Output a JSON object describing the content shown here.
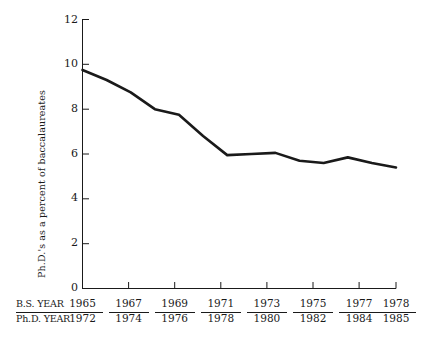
{
  "chart_data": {
    "type": "line",
    "title": "",
    "xlabel": "",
    "ylabel": "Ph.D.'s as a percent of baccalaureates",
    "ylim": [
      0,
      12
    ],
    "yticks": [
      0,
      2,
      4,
      6,
      8,
      10,
      12
    ],
    "ytick_labels": [
      "0",
      "2",
      "4",
      "6",
      "8",
      "10",
      "12"
    ],
    "grid": false,
    "legend": "none",
    "x_axis_rows": [
      {
        "label": "B.S. YEAR",
        "underlined": true
      },
      {
        "label": "Ph.D. YEAR",
        "underlined": false
      }
    ],
    "xtick_labels_bs": [
      "1965",
      "1967",
      "1969",
      "1971",
      "1973",
      "1975",
      "1977",
      "1978"
    ],
    "xtick_labels_phd": [
      "1972",
      "1974",
      "1976",
      "1978",
      "1980",
      "1982",
      "1984",
      "1985"
    ],
    "bs_years": [
      1965,
      1966,
      1967,
      1968,
      1969,
      1970,
      1971,
      1972,
      1973,
      1974,
      1975,
      1976,
      1977,
      1978
    ],
    "phd_years": [
      1972,
      1973,
      1974,
      1975,
      1976,
      1977,
      1978,
      1979,
      1980,
      1981,
      1982,
      1983,
      1984,
      1985
    ],
    "values": [
      9.75,
      9.3,
      8.75,
      8.0,
      7.75,
      6.8,
      5.95,
      6.0,
      6.05,
      5.7,
      5.6,
      5.85,
      5.6,
      5.4
    ],
    "series": [
      {
        "name": "Ph.D.'s as a percent of baccalaureates",
        "values": [
          9.75,
          9.3,
          8.75,
          8.0,
          7.75,
          6.8,
          5.95,
          6.0,
          6.05,
          5.7,
          5.6,
          5.85,
          5.6,
          5.4
        ]
      }
    ],
    "line_color": "#1a1a1a",
    "line_width": 2.6
  }
}
